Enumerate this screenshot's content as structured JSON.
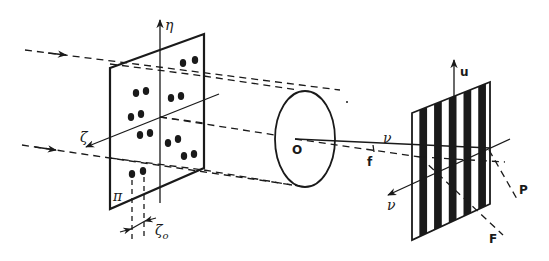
{
  "diagram": {
    "title": "",
    "background": "#ffffff",
    "ink": "#1a1a1a",
    "labels": {
      "eta": "η",
      "zeta": "ζ",
      "zeta0_main": "ζ",
      "zeta0_sub": "o",
      "pi": "π",
      "origin": "O",
      "f": "f",
      "u": "u",
      "nu_top": "ν",
      "nu_arrow": "ν",
      "P": "P",
      "F": "F"
    },
    "object_plane": {
      "name": "π",
      "dot_pairs": [
        {
          "x1": 183,
          "y1": 63,
          "x2": 195,
          "y2": 60
        },
        {
          "x1": 136,
          "y1": 93,
          "x2": 146,
          "y2": 91
        },
        {
          "x1": 171,
          "y1": 98,
          "x2": 181,
          "y2": 96
        },
        {
          "x1": 131,
          "y1": 117,
          "x2": 141,
          "y2": 114
        },
        {
          "x1": 140,
          "y1": 135,
          "x2": 150,
          "y2": 133
        },
        {
          "x1": 168,
          "y1": 143,
          "x2": 178,
          "y2": 139
        },
        {
          "x1": 184,
          "y1": 156,
          "x2": 194,
          "y2": 154
        },
        {
          "x1": 132,
          "y1": 174,
          "x2": 143,
          "y2": 171
        }
      ]
    },
    "lens": {
      "cx": 305,
      "cy": 139,
      "rx": 30,
      "ry": 48
    },
    "grating": {
      "stripes": 5
    }
  }
}
